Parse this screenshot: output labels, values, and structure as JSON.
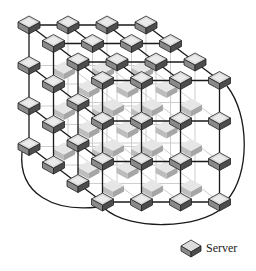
{
  "diagram": {
    "grid": {
      "cols": 4,
      "rows": 4,
      "depth": 4
    },
    "geometry": {
      "origin": [
        29,
        25
      ],
      "col_step": [
        39,
        0
      ],
      "row_step": [
        0,
        40.5
      ],
      "depth_step": [
        24.5,
        18.5
      ],
      "node_half_width": 11,
      "node_half_height": 6,
      "node_thickness": 6
    },
    "colors": {
      "edge_dark": "#1a1a1a",
      "edge_light": "#c8c8c8",
      "node_top": "#d9d9d9",
      "node_top_highlight": "#f2f2f2",
      "node_left": "#8a8a8a",
      "node_right": "#4d4d4d",
      "ghost_top": "#e6e6e6",
      "ghost_left": "#bdbdbd",
      "ghost_right": "#a6a6a6"
    },
    "wraparound_arcs": [
      {
        "name": "left-bottom-wrap",
        "d": "M22 152 C 18 195, 55 212, 98 207"
      },
      {
        "name": "front-bottom-wrap",
        "d": "M104 208 C 130 232, 200 228, 222 208"
      },
      {
        "name": "right-side-wrap",
        "d": "M227 86 C 250 115, 250 175, 227 200"
      }
    ]
  },
  "legend": {
    "icon": "server-icon",
    "label": "Server"
  }
}
